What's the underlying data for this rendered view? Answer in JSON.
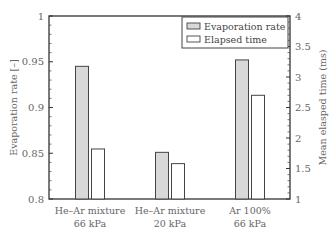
{
  "chart_data": {
    "type": "bar",
    "title": "",
    "categories": [
      "He–Ar mixture\n66 kPa",
      "He–Ar mixture\n20 kPa",
      "Ar 100%\n66 kPa"
    ],
    "category_lines": [
      [
        "He–Ar mixture",
        "66 kPa"
      ],
      [
        "He–Ar mixture",
        "20 kPa"
      ],
      [
        "Ar 100%",
        "66 kPa"
      ]
    ],
    "series": [
      {
        "name": "Evaporation rate",
        "axis": "left",
        "color": "#d8d8d8",
        "values": [
          0.945,
          0.851,
          0.952
        ]
      },
      {
        "name": "Elapsed time",
        "axis": "right",
        "color": "#ffffff",
        "values": [
          1.82,
          1.58,
          2.7
        ]
      }
    ],
    "ylabel": "Evaporation rate [–]",
    "ylim": [
      0.8,
      1.0
    ],
    "yticks": [
      "0.8",
      "0.85",
      "0.9",
      "0.95",
      "1"
    ],
    "y2label": "Mean elasped time (ms)",
    "y2lim": [
      1,
      4
    ],
    "y2ticks": [
      "1",
      "1.5",
      "2",
      "2.5",
      "3",
      "3.5",
      "4"
    ],
    "grid": false,
    "legend_position": "upper right"
  }
}
